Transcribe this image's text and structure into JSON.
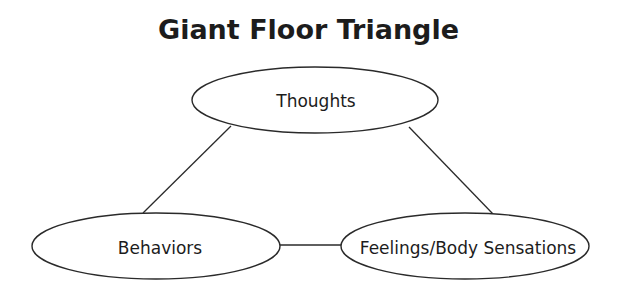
{
  "title": "Giant Floor Triangle",
  "nodes": [
    {
      "id": "thoughts",
      "label": "Thoughts",
      "cx": 315,
      "cy": 100,
      "rx": 123,
      "ry": 33
    },
    {
      "id": "behaviors",
      "label": "Behaviors",
      "cx": 156,
      "cy": 246,
      "rx": 124,
      "ry": 33
    },
    {
      "id": "feelings",
      "label": "Feelings/Body Sensations",
      "cx": 465,
      "cy": 246,
      "rx": 124,
      "ry": 33
    }
  ],
  "edges": [
    {
      "from": "thoughts",
      "to": "behaviors"
    },
    {
      "from": "thoughts",
      "to": "feelings"
    },
    {
      "from": "behaviors",
      "to": "feelings"
    }
  ],
  "colors": {
    "stroke": "#2a2a2a",
    "background": "#ffffff",
    "text": "#1c1c1c"
  }
}
